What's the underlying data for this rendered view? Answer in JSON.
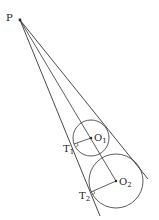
{
  "diagram": {
    "points": {
      "P": {
        "label": "P",
        "x": 20,
        "y": 20
      },
      "O1": {
        "label": "O",
        "sub": "1",
        "x": 91,
        "y": 138
      },
      "O2": {
        "label": "O",
        "sub": "2",
        "x": 116,
        "y": 181
      },
      "T1": {
        "label": "T",
        "sub": "1",
        "x": 74,
        "y": 143
      },
      "T2": {
        "label": "T",
        "sub": "2",
        "x": 91,
        "y": 192
      }
    },
    "circles": [
      {
        "center": "O1",
        "r": 18
      },
      {
        "center": "O2",
        "r": 27
      }
    ],
    "colors": {
      "stroke": "#333333",
      "background": "#ffffff"
    }
  }
}
